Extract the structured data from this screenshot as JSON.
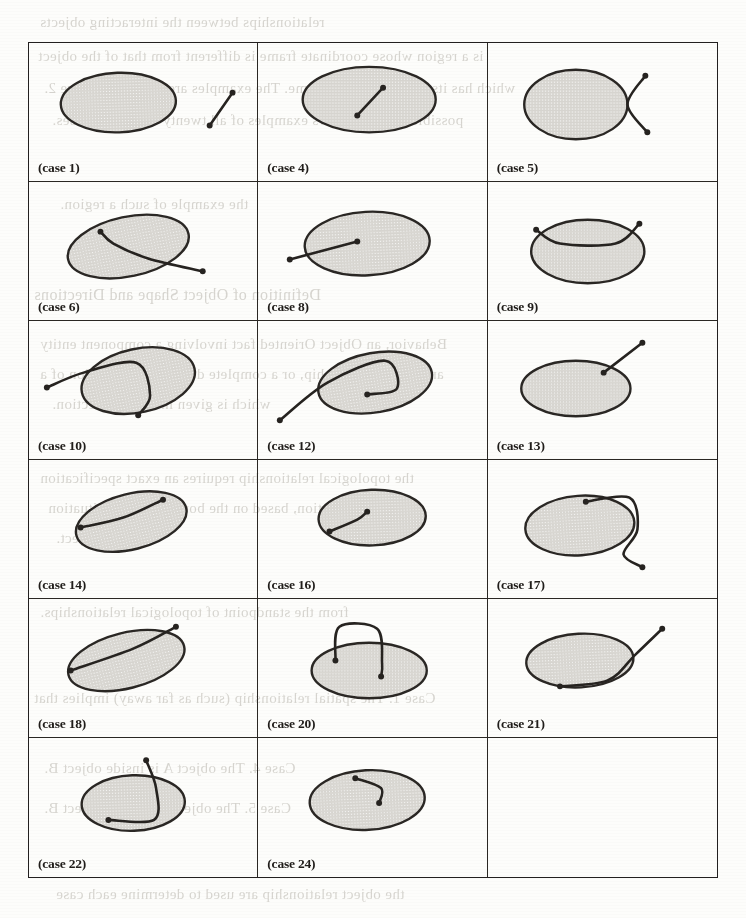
{
  "figure": {
    "columns": 3,
    "rows": 6,
    "cells": [
      {
        "label": "(case 1)",
        "ellipse": {
          "cx": 90,
          "cy": 60,
          "rx": 58,
          "ry": 30,
          "rot": -2
        },
        "description": "line segment entirely outside the ellipse, to the right",
        "stroke": [
          [
            182,
            83
          ],
          [
            205,
            50
          ]
        ],
        "dots": [
          [
            182,
            83
          ],
          [
            205,
            50
          ]
        ]
      },
      {
        "label": "(case 4)",
        "ellipse": {
          "cx": 112,
          "cy": 57,
          "rx": 67,
          "ry": 33,
          "rot": 0
        },
        "description": "line segment entirely inside the ellipse",
        "stroke": [
          [
            100,
            73
          ],
          [
            126,
            45
          ]
        ],
        "dots": [
          [
            100,
            73
          ],
          [
            126,
            45
          ]
        ]
      },
      {
        "label": "(case 5)",
        "ellipse": {
          "cx": 88,
          "cy": 62,
          "rx": 52,
          "ry": 35,
          "rot": 0
        },
        "description": "bent polyline touching the ellipse at the right vertex, both arms outside",
        "stroke": [
          [
            160,
            90
          ],
          [
            140,
            62
          ],
          [
            158,
            33
          ]
        ],
        "dots": [
          [
            160,
            90
          ],
          [
            158,
            33
          ]
        ]
      },
      {
        "label": "(case 6)",
        "ellipse": {
          "cx": 100,
          "cy": 65,
          "rx": 62,
          "ry": 30,
          "rot": -12
        },
        "description": "curve crossing the ellipse, entering at top and leaving at right",
        "stroke": [
          [
            72,
            50
          ],
          [
            85,
            62
          ],
          [
            120,
            77
          ],
          [
            175,
            90
          ]
        ],
        "dots": [
          [
            72,
            50
          ],
          [
            175,
            90
          ]
        ]
      },
      {
        "label": "(case 8)",
        "ellipse": {
          "cx": 110,
          "cy": 62,
          "rx": 63,
          "ry": 32,
          "rot": -3
        },
        "description": "line from outside the ellipse terminating inside it",
        "stroke": [
          [
            32,
            78
          ],
          [
            100,
            60
          ]
        ],
        "dots": [
          [
            32,
            78
          ],
          [
            100,
            60
          ]
        ]
      },
      {
        "label": "(case 9)",
        "ellipse": {
          "cx": 100,
          "cy": 70,
          "rx": 57,
          "ry": 32,
          "rot": 0
        },
        "description": "polyline riding over the top of the ellipse, both ends outside",
        "stroke": [
          [
            48,
            48
          ],
          [
            72,
            62
          ],
          [
            128,
            62
          ],
          [
            152,
            42
          ]
        ],
        "dots": [
          [
            48,
            48
          ],
          [
            152,
            42
          ]
        ]
      },
      {
        "label": "(case 10)",
        "ellipse": {
          "cx": 110,
          "cy": 60,
          "rx": 58,
          "ry": 32,
          "rot": -12
        },
        "description": "curve entering the ellipse at the left and exiting at the bottom",
        "stroke": [
          [
            18,
            67
          ],
          [
            55,
            52
          ],
          [
            108,
            42
          ],
          [
            122,
            75
          ],
          [
            110,
            95
          ]
        ],
        "dots": [
          [
            18,
            67
          ],
          [
            110,
            95
          ]
        ]
      },
      {
        "label": "(case 12)",
        "ellipse": {
          "cx": 118,
          "cy": 62,
          "rx": 58,
          "ry": 30,
          "rot": -10
        },
        "description": "curve from outside entering the ellipse and ending inside with a hook",
        "stroke": [
          [
            22,
            100
          ],
          [
            70,
            62
          ],
          [
            128,
            40
          ],
          [
            140,
            68
          ],
          [
            110,
            74
          ]
        ],
        "dots": [
          [
            22,
            100
          ],
          [
            110,
            74
          ]
        ]
      },
      {
        "label": "(case 13)",
        "ellipse": {
          "cx": 88,
          "cy": 68,
          "rx": 55,
          "ry": 28,
          "rot": 0
        },
        "description": "line touching the ellipse boundary at the upper right, pointing outward",
        "stroke": [
          [
            116,
            52
          ],
          [
            155,
            22
          ]
        ],
        "dots": [
          [
            116,
            52
          ],
          [
            155,
            22
          ]
        ]
      },
      {
        "label": "(case 14)",
        "ellipse": {
          "cx": 103,
          "cy": 62,
          "rx": 57,
          "ry": 28,
          "rot": -14
        },
        "description": "chord inside the ellipse with both endpoints on the boundary",
        "stroke": [
          [
            52,
            68
          ],
          [
            95,
            58
          ],
          [
            135,
            40
          ]
        ],
        "dots": [
          [
            52,
            68
          ],
          [
            135,
            40
          ]
        ]
      },
      {
        "label": "(case 16)",
        "ellipse": {
          "cx": 115,
          "cy": 58,
          "rx": 54,
          "ry": 28,
          "rot": -2
        },
        "description": "short curve inside the ellipse, one endpoint on the boundary",
        "stroke": [
          [
            72,
            72
          ],
          [
            100,
            60
          ],
          [
            110,
            52
          ]
        ],
        "dots": [
          [
            72,
            72
          ],
          [
            110,
            52
          ]
        ]
      },
      {
        "label": "(case 17)",
        "ellipse": {
          "cx": 92,
          "cy": 66,
          "rx": 55,
          "ry": 30,
          "rot": -4
        },
        "description": "curve starting on the top boundary, looping right and leaving outside",
        "stroke": [
          [
            98,
            42
          ],
          [
            142,
            38
          ],
          [
            150,
            70
          ],
          [
            136,
            95
          ],
          [
            155,
            108
          ]
        ],
        "dots": [
          [
            98,
            42
          ],
          [
            155,
            108
          ]
        ]
      },
      {
        "label": "(case 18)",
        "ellipse": {
          "cx": 98,
          "cy": 62,
          "rx": 60,
          "ry": 28,
          "rot": -14
        },
        "description": "line from a boundary point through the ellipse and out the upper right",
        "stroke": [
          [
            42,
            72
          ],
          [
            105,
            50
          ],
          [
            148,
            28
          ]
        ],
        "dots": [
          [
            42,
            72
          ],
          [
            148,
            28
          ]
        ]
      },
      {
        "label": "(case 20)",
        "ellipse": {
          "cx": 112,
          "cy": 72,
          "rx": 58,
          "ry": 28,
          "rot": 0
        },
        "description": "arc rising above the ellipse from a boundary dot into an interior dot",
        "stroke": [
          [
            78,
            62
          ],
          [
            82,
            28
          ],
          [
            120,
            30
          ],
          [
            125,
            65
          ],
          [
            124,
            78
          ]
        ],
        "dots": [
          [
            78,
            62
          ],
          [
            124,
            78
          ]
        ]
      },
      {
        "label": "(case 21)",
        "ellipse": {
          "cx": 92,
          "cy": 62,
          "rx": 54,
          "ry": 27,
          "rot": -3
        },
        "description": "curve from the lower boundary running along the edge and out to the upper right",
        "stroke": [
          [
            72,
            88
          ],
          [
            120,
            82
          ],
          [
            148,
            56
          ],
          [
            175,
            30
          ]
        ],
        "dots": [
          [
            72,
            88
          ],
          [
            175,
            30
          ]
        ]
      },
      {
        "label": "(case 22)",
        "ellipse": {
          "cx": 105,
          "cy": 65,
          "rx": 52,
          "ry": 28,
          "rot": -2
        },
        "description": "curve descending from outside through the ellipse to a dot on the lower boundary",
        "stroke": [
          [
            118,
            22
          ],
          [
            128,
            50
          ],
          [
            126,
            82
          ],
          [
            80,
            82
          ]
        ],
        "dots": [
          [
            118,
            22
          ],
          [
            80,
            82
          ]
        ]
      },
      {
        "label": "(case 24)",
        "ellipse": {
          "cx": 110,
          "cy": 62,
          "rx": 58,
          "ry": 30,
          "rot": -3
        },
        "description": "short curve from the upper boundary ending inside the ellipse",
        "stroke": [
          [
            98,
            40
          ],
          [
            124,
            50
          ],
          [
            122,
            65
          ]
        ],
        "dots": [
          [
            98,
            40
          ],
          [
            122,
            65
          ]
        ]
      },
      {
        "label": "",
        "ellipse": null,
        "description": "empty cell",
        "stroke": [],
        "dots": []
      }
    ]
  },
  "colors": {
    "ink": "#262320",
    "ellipse_fill": "#d9d7d2",
    "ellipse_stroke": "#2a2724",
    "grid": "#232020",
    "page": "#fdfdfb",
    "bleed_text": "#b9b6ae"
  },
  "background_text": {
    "top": [
      "relationships between the interacting objects",
      "is a region whose coordinate frame is different from that of the object",
      "which has its own coordinate frame. The examples are shown in Figure 2.",
      "possible. Table 1 shows examples of all twenty-four these cases."
    ],
    "left_mid": [
      "the example of such a region.",
      "Definition of Object Shape and Directions",
      "Behavior, an Object Oriented fact involving a component entity",
      "and some relationship, or a complete definition of a region of a",
      "which is given in the next section.",
      "the topological relationship requires an exact specification",
      "A spatial relation, based on the boundary/point situation",
      "of the object."
    ],
    "lower": [
      "from the standpoint of topological relationships.",
      "Case 1. The spatial relationship (such as far away) implies that",
      "Case 4. The object A is inside object B.",
      "Case 5. The object A touches object B."
    ],
    "bottom": "the object relationship are used to determine each case"
  }
}
